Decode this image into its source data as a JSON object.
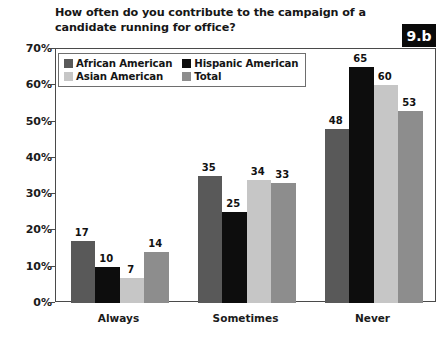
{
  "figure": {
    "badge_label": "9.b",
    "badge_bg": "#0a0a0a",
    "badge_fg": "#ffffff"
  },
  "chart_data": {
    "type": "bar",
    "title": "How often do you contribute to the campaign of a candidate running for office?",
    "xlabel": "",
    "ylabel": "",
    "ylim": [
      0,
      70
    ],
    "y_tick_labels": [
      "0%",
      "10%",
      "20%",
      "30%",
      "40%",
      "50%",
      "60%",
      "70%"
    ],
    "y_tick_values": [
      0,
      10,
      20,
      30,
      40,
      50,
      60,
      70
    ],
    "grid": false,
    "legend_position": "upper-left-inside",
    "value_suffix": "",
    "categories": [
      "Always",
      "Sometimes",
      "Never"
    ],
    "series": [
      {
        "name": "African American",
        "color": "#595959",
        "values": [
          17,
          35,
          48
        ],
        "labels": [
          "17",
          "35",
          "48"
        ]
      },
      {
        "name": "Hispanic American",
        "color": "#0d0d0d",
        "values": [
          10,
          25,
          65
        ],
        "labels": [
          "10",
          "25",
          "65"
        ]
      },
      {
        "name": "Asian American",
        "color": "#c6c6c6",
        "values": [
          7,
          34,
          60
        ],
        "labels": [
          "7",
          "34",
          "60"
        ]
      },
      {
        "name": "Total",
        "color": "#8d8d8d",
        "values": [
          14,
          33,
          53
        ],
        "labels": [
          "14",
          "33",
          "53"
        ]
      }
    ]
  }
}
